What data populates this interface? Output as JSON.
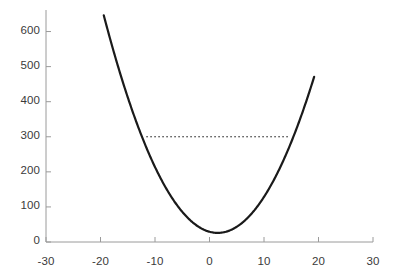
{
  "chart_data": {
    "type": "line",
    "title": "",
    "subtitle": "",
    "xlabel": "",
    "ylabel": "",
    "xlim": [
      -30,
      30
    ],
    "ylim": [
      0,
      650
    ],
    "xticks": [
      -30,
      -20,
      -10,
      0,
      10,
      20,
      30
    ],
    "xticklabels": [
      "-30",
      "-20",
      "-10",
      "0",
      "10",
      "20",
      "30"
    ],
    "yticks": [
      0,
      100,
      200,
      300,
      400,
      500,
      600
    ],
    "yticklabels": [
      "0",
      "100",
      "200",
      "300",
      "400",
      "500",
      "600"
    ],
    "grid": false,
    "legend": null,
    "legend_position": "none",
    "axis_color": "#9a9a9a",
    "tick_label_color": "#3a3a3a",
    "background_color": "#ffffff",
    "series": [
      {
        "name": "parabola",
        "type": "line",
        "color": "#1a1a1a",
        "linewidth": 2.2,
        "linestyle": "solid",
        "vertex": [
          1.5,
          26
        ],
        "quadratic_a": 1.42,
        "x": [
          -19.4,
          -18.5,
          -17.5,
          -16.5,
          -15.5,
          -14.5,
          -13.5,
          -12.5,
          -11.5,
          -10.5,
          -9.5,
          -8.5,
          -7.5,
          -6.5,
          -5.5,
          -4.5,
          -3.5,
          -2.5,
          -1.5,
          -0.5,
          0.5,
          1.5,
          2.5,
          3.5,
          4.5,
          5.5,
          6.5,
          7.5,
          8.5,
          9.5,
          10.5,
          11.5,
          12.5,
          13.5,
          14.5,
          15.5,
          16.5,
          17.5,
          18.5,
          19.2
        ],
        "y": [
          645,
          594,
          540,
          488,
          438,
          390,
          345,
          302,
          261,
          222,
          185,
          151,
          119,
          89,
          61,
          36,
          61,
          26,
          39,
          32,
          27,
          26,
          27,
          32,
          39,
          49,
          62,
          78,
          96,
          117,
          140,
          166,
          194,
          225,
          258,
          294,
          332,
          372,
          415,
          446
        ]
      }
    ],
    "annotations": [
      {
        "type": "hline",
        "name": "reference-line",
        "y": 300,
        "x_start": -11.6,
        "x_end": 14.4,
        "linestyle": "dotted",
        "color": "#1a1a1a",
        "linewidth": 1
      }
    ]
  },
  "axes": {
    "y_axis_name": "y-axis",
    "x_axis_name": "x-axis"
  }
}
